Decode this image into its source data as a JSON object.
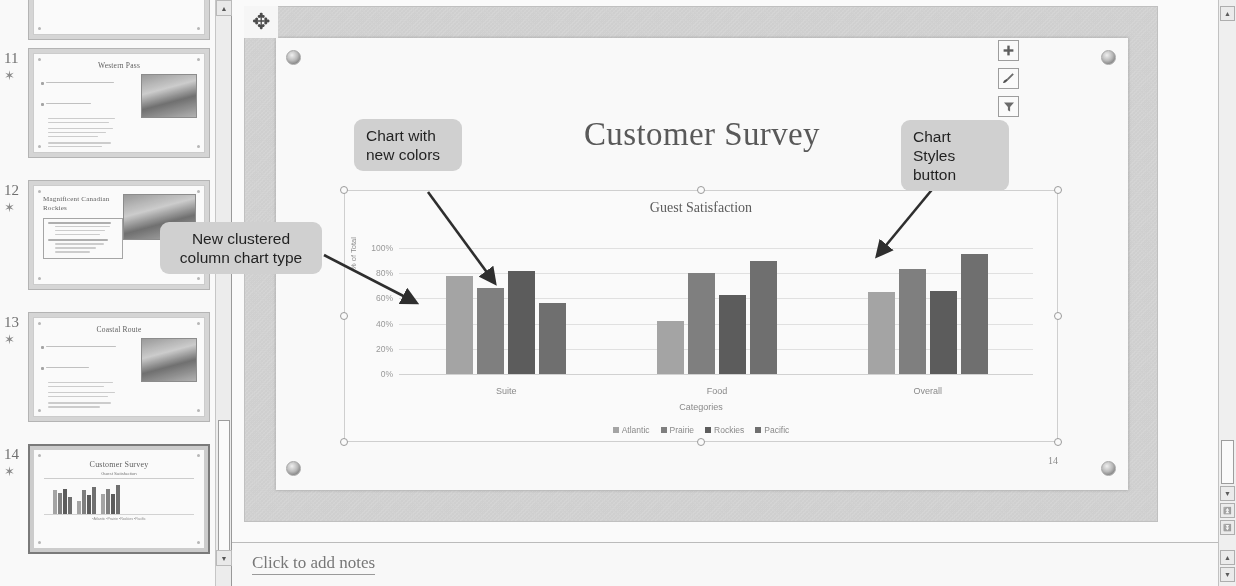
{
  "app": {
    "notes_placeholder": "Click to add notes"
  },
  "thumbnails": {
    "items": [
      {
        "number": "",
        "title": "",
        "type": "partial"
      },
      {
        "number": "11",
        "title": "Western Pass",
        "type": "bullets-photo",
        "selected": false
      },
      {
        "number": "12",
        "title": "Magnificent Canadian Rockies",
        "type": "title-left-photo",
        "selected": false
      },
      {
        "number": "13",
        "title": "Coastal Route",
        "type": "bullets-photo",
        "selected": false
      },
      {
        "number": "14",
        "title": "Customer Survey",
        "type": "chart",
        "selected": true
      }
    ],
    "star_glyph": "✶",
    "plus_glyph": "+"
  },
  "slide": {
    "title": "Customer Survey",
    "number": "14",
    "move_cursor_icon": "move-cursor-icon"
  },
  "chart_data": {
    "type": "bar",
    "title": "Guest Satisfaction",
    "xlabel": "Categories",
    "ylabel": "% of Total",
    "categories": [
      "Suite",
      "Food",
      "Overall"
    ],
    "series": [
      {
        "name": "Atlantic",
        "values": [
          78,
          42,
          65
        ],
        "color": "#a6a6a6"
      },
      {
        "name": "Prairie",
        "values": [
          68,
          80,
          83
        ],
        "color": "#7f7f7f"
      },
      {
        "name": "Rockies",
        "values": [
          82,
          63,
          66
        ],
        "color": "#5a5a5a"
      },
      {
        "name": "Pacific",
        "values": [
          56,
          90,
          95
        ],
        "color": "#6e6e6e"
      }
    ],
    "ylim": [
      0,
      100
    ],
    "yticks": [
      "0%",
      "20%",
      "40%",
      "60%",
      "80%",
      "100%"
    ],
    "ytick_values": [
      0,
      20,
      40,
      60,
      80,
      100
    ],
    "grid": true,
    "legend_position": "bottom"
  },
  "chart_buttons": [
    {
      "name": "chart-elements-button",
      "icon": "plus-icon",
      "glyph": "✚"
    },
    {
      "name": "chart-styles-button",
      "icon": "paintbrush-icon",
      "glyph": "🖌"
    },
    {
      "name": "chart-filters-button",
      "icon": "funnel-icon",
      "glyph": "▼"
    }
  ],
  "callouts": [
    {
      "id": "new-colors",
      "text": "Chart with\nnew colors"
    },
    {
      "id": "chart-styles",
      "text": "Chart Styles\nbutton"
    },
    {
      "id": "clustered-type",
      "text": "New clustered\ncolumn chart type"
    }
  ],
  "scrollbars": {
    "up_glyph": "▲",
    "down_glyph": "▼",
    "prev_slide_glyph": "⏫",
    "next_slide_glyph": "⏬"
  }
}
